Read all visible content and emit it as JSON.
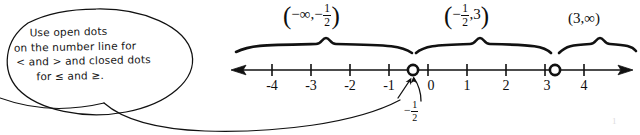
{
  "note": {
    "lines": [
      "Use open dots",
      "on the number line for",
      "< and > and closed dots",
      "for ≤ and ≥."
    ]
  },
  "number_line": {
    "tick_labels": [
      "-4",
      "-3",
      "-2",
      "-1",
      "0",
      "1",
      "2",
      "3",
      "4"
    ],
    "tick_values": [
      -4,
      -3,
      -2,
      -1,
      0,
      1,
      2,
      3,
      4
    ],
    "left_arrow": "←",
    "right_arrow": "→",
    "open_points": [
      "-1/2",
      "3"
    ],
    "point_callout": {
      "sign": "−",
      "numerator": "1",
      "denominator": "2"
    }
  },
  "intervals": [
    {
      "name": "interval-neg-inf-to-neg-half",
      "open_paren": "(",
      "close_paren": ")",
      "left": "−∞",
      "comma": ",",
      "right_sign": "−",
      "right_numerator": "1",
      "right_denominator": "2"
    },
    {
      "name": "interval-neg-half-to-three",
      "open_paren": "(",
      "close_paren": ")",
      "left_sign": "−",
      "left_numerator": "1",
      "left_denominator": "2",
      "comma": ",",
      "right": "3"
    },
    {
      "name": "interval-three-to-inf",
      "text": "(3,∞)"
    }
  ],
  "artifact": {
    "mark": "1"
  }
}
